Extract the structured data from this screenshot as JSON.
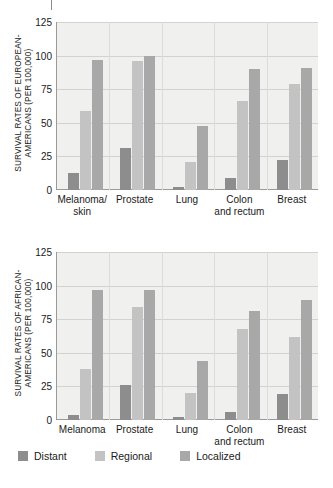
{
  "chart_data": [
    {
      "id": "european-americans",
      "type": "bar",
      "title": "",
      "ylabel": "SURVIVAL RATES OF EUROPEAN-AMERICANS (PER 100,000)",
      "ylabel_line1": "SURVIVAL RATES OF EUROPEAN-",
      "ylabel_line2": "AMERICANS (PER 100,000)",
      "xlabel": "",
      "ylim": [
        0,
        125
      ],
      "yticks": [
        0,
        25,
        50,
        75,
        100,
        125
      ],
      "ytick_labels": [
        "0",
        "25",
        "50",
        "75",
        "100",
        "125"
      ],
      "grid": true,
      "legend_position": "below-figure",
      "categories": [
        "Melanoma/\nskin",
        "Prostate",
        "Lung",
        "Colon\nand rectum",
        "Breast"
      ],
      "series": [
        {
          "name": "Distant",
          "values": [
            13,
            31,
            2,
            9,
            22
          ]
        },
        {
          "name": "Regional",
          "values": [
            59,
            96,
            21,
            66,
            79
          ]
        },
        {
          "name": "Localized",
          "values": [
            97,
            100,
            48,
            90,
            91
          ]
        }
      ]
    },
    {
      "id": "african-americans",
      "type": "bar",
      "title": "",
      "ylabel": "SURVIVAL RATES OF AFRICAN-AMERICANS (PER 100,000)",
      "ylabel_line1": "SURVIVAL RATES OF AFRICAN-",
      "ylabel_line2": "AMERICANS (PER 100,000)",
      "xlabel": "",
      "ylim": [
        0,
        125
      ],
      "yticks": [
        0,
        25,
        50,
        75,
        100,
        125
      ],
      "ytick_labels": [
        "0",
        "25",
        "50",
        "75",
        "100",
        "125"
      ],
      "grid": true,
      "legend_position": "below-figure",
      "categories": [
        "Melanoma",
        "Prostate",
        "Lung",
        "Colon\nand rectum",
        "Breast"
      ],
      "series": [
        {
          "name": "Distant",
          "values": [
            4,
            26,
            2,
            6,
            19
          ]
        },
        {
          "name": "Regional",
          "values": [
            38,
            84,
            20,
            68,
            62
          ]
        },
        {
          "name": "Localized",
          "values": [
            97,
            97,
            44,
            81,
            89
          ]
        }
      ]
    }
  ],
  "legend": {
    "items": [
      {
        "label": "Distant",
        "color": "#8d8d8d",
        "key": "distant"
      },
      {
        "label": "Regional",
        "color": "#c3c3c3",
        "key": "regional"
      },
      {
        "label": "Localized",
        "color": "#a8a8a8",
        "key": "localized"
      }
    ]
  },
  "colors": {
    "distant": "#8d8d8d",
    "regional": "#c3c3c3",
    "localized": "#a8a8a8",
    "plot_background": "#f0f0ee",
    "gridline": "#d2d2cf",
    "axis": "#9a9a9a",
    "text": "#1a1a1a"
  }
}
